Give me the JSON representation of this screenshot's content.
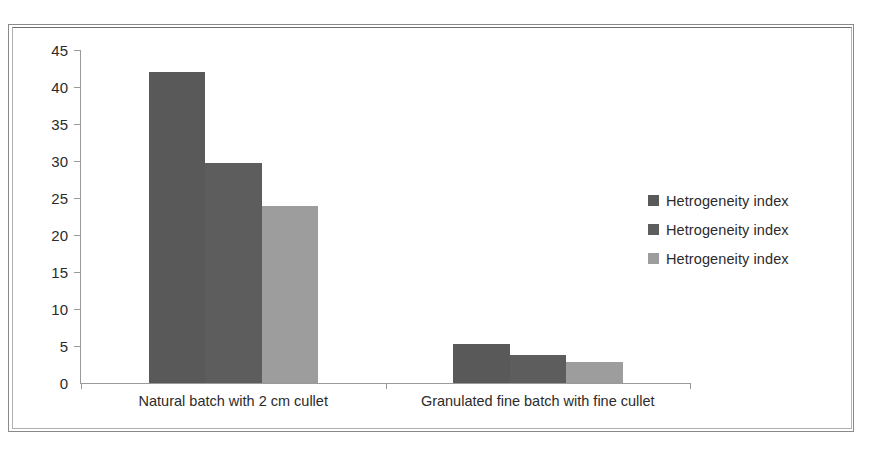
{
  "chart_data": {
    "type": "bar",
    "title": "",
    "xlabel": "",
    "ylabel": "",
    "ylim": [
      0,
      45
    ],
    "yticks": [
      45,
      40,
      35,
      30,
      25,
      20,
      15,
      10,
      5,
      0
    ],
    "grid": false,
    "legend_position": "right",
    "categories": [
      "Natural batch with 2 cm cullet",
      "Granulated fine batch with fine cullet"
    ],
    "series": [
      {
        "name": "Hetrogeneity index",
        "color": "#595959",
        "values": [
          42.0,
          5.3
        ]
      },
      {
        "name": "Hetrogeneity index",
        "color": "#5d5d5d",
        "values": [
          29.7,
          3.8
        ]
      },
      {
        "name": "Hetrogeneity index",
        "color": "#9d9d9d",
        "values": [
          23.9,
          2.9
        ]
      }
    ]
  },
  "legend": {
    "entries": [
      {
        "label": "Hetrogeneity index",
        "color": "#595959"
      },
      {
        "label": "Hetrogeneity index",
        "color": "#5d5d5d"
      },
      {
        "label": "Hetrogeneity index",
        "color": "#9d9d9d"
      }
    ]
  },
  "axis": {
    "y_tick_labels": [
      "45",
      "40",
      "35",
      "30",
      "25",
      "20",
      "15",
      "10",
      "5",
      "0"
    ]
  },
  "colors": {
    "series_1": "#595959",
    "series_2": "#5d5d5d",
    "series_3": "#9d9d9d",
    "axis_line": "#9a9a9a",
    "text": "#2b2b2b",
    "frame": "#8a8a8a",
    "background": "#ffffff"
  }
}
